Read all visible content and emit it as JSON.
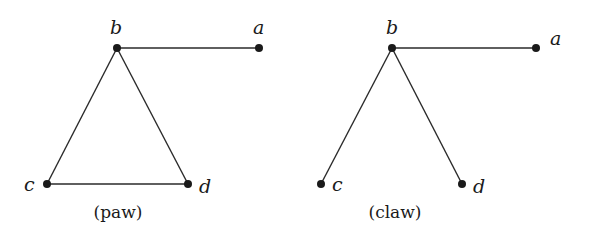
{
  "figure": {
    "graphs": [
      {
        "name": "paw",
        "caption": "(paw)",
        "vertices": [
          {
            "id": "a",
            "label": "a",
            "x": 259,
            "y": 48
          },
          {
            "id": "b",
            "label": "b",
            "x": 117,
            "y": 48
          },
          {
            "id": "c",
            "label": "c",
            "x": 47,
            "y": 184
          },
          {
            "id": "d",
            "label": "d",
            "x": 188,
            "y": 184
          }
        ],
        "edges": [
          [
            "b",
            "a"
          ],
          [
            "b",
            "c"
          ],
          [
            "b",
            "d"
          ],
          [
            "c",
            "d"
          ]
        ]
      },
      {
        "name": "claw",
        "caption": "(claw)",
        "vertices": [
          {
            "id": "a",
            "label": "a",
            "x": 536,
            "y": 48
          },
          {
            "id": "b",
            "label": "b",
            "x": 392,
            "y": 48
          },
          {
            "id": "c",
            "label": "c",
            "x": 321,
            "y": 184
          },
          {
            "id": "d",
            "label": "d",
            "x": 462,
            "y": 184
          }
        ],
        "edges": [
          [
            "b",
            "a"
          ],
          [
            "b",
            "c"
          ],
          [
            "b",
            "d"
          ]
        ]
      }
    ]
  }
}
